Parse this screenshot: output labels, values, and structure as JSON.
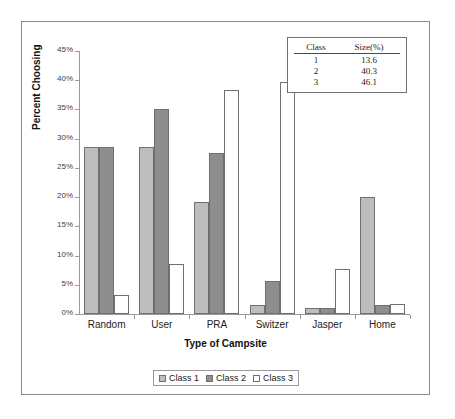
{
  "chart_data": {
    "type": "bar",
    "title": "",
    "xlabel": "Type of Campsite",
    "ylabel": "Percent Choosing",
    "categories": [
      "Random",
      "User",
      "PRA",
      "Switzer",
      "Jasper",
      "Home"
    ],
    "series": [
      {
        "name": "Class 1",
        "color": "#bdbdbd",
        "values": [
          28.5,
          28.6,
          19.2,
          1.6,
          1.0,
          20.0
        ]
      },
      {
        "name": "Class 2",
        "color": "#8e8e8e",
        "values": [
          28.6,
          35.1,
          27.6,
          5.7,
          1.0,
          1.5
        ]
      },
      {
        "name": "Class 3",
        "color": "#ffffff",
        "values": [
          3.2,
          8.5,
          38.4,
          39.7,
          7.7,
          1.7
        ]
      }
    ],
    "ylim": [
      0,
      45
    ],
    "yticks": [
      "0%",
      "5%",
      "10%",
      "15%",
      "20%",
      "25%",
      "30%",
      "35%",
      "40%",
      "45%"
    ],
    "ytick_values": [
      0,
      5,
      10,
      15,
      20,
      25,
      30,
      35,
      40,
      45
    ],
    "grid": false,
    "legend_position": "bottom"
  },
  "legend": {
    "items": [
      {
        "label": "Class 1"
      },
      {
        "label": "Class 2"
      },
      {
        "label": "Class 3"
      }
    ]
  },
  "inset_table": {
    "headers": [
      "Class",
      "Size(%)"
    ],
    "rows": [
      {
        "class": "1",
        "size": "13.6"
      },
      {
        "class": "2",
        "size": "40.3"
      },
      {
        "class": "3",
        "size": "46.1"
      }
    ]
  }
}
